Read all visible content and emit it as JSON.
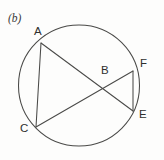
{
  "figure": {
    "caption": "(b)",
    "canvas": {
      "width": 164,
      "height": 160
    },
    "colors": {
      "background": "#fdfdfc",
      "stroke": "#4a4a48",
      "label": "#2f2f2e",
      "caption": "#39393a"
    },
    "circle": {
      "name": "main-circle",
      "cx": 79,
      "cy": 85.5,
      "r": 60.5
    },
    "points": [
      {
        "id": "A",
        "label": "A",
        "x": 41,
        "y": 43,
        "label_x": 34,
        "label_y": 35,
        "on_circle": true
      },
      {
        "id": "B",
        "label": "B",
        "x": 105,
        "y": 86,
        "label_x": 101,
        "label_y": 74,
        "on_circle": false
      },
      {
        "id": "C",
        "label": "C",
        "x": 36,
        "y": 127,
        "label_x": 20,
        "label_y": 132,
        "on_circle": true
      },
      {
        "id": "E",
        "label": "E",
        "x": 133,
        "y": 111,
        "label_x": 139,
        "label_y": 118,
        "on_circle": true
      },
      {
        "id": "F",
        "label": "F",
        "x": 133,
        "y": 71,
        "label_x": 140,
        "label_y": 67,
        "on_circle": true
      }
    ],
    "chords": [
      {
        "id": "AC",
        "from": "A",
        "to": "C",
        "x1": 41,
        "y1": 43,
        "x2": 36,
        "y2": 127
      },
      {
        "id": "AE",
        "from": "A",
        "to": "E",
        "x1": 41,
        "y1": 43,
        "x2": 133,
        "y2": 111
      },
      {
        "id": "CF",
        "from": "C",
        "to": "F",
        "x1": 36,
        "y1": 127,
        "x2": 133,
        "y2": 71
      },
      {
        "id": "FE",
        "from": "F",
        "to": "E",
        "x1": 133,
        "y1": 71,
        "x2": 133,
        "y2": 111
      }
    ]
  }
}
